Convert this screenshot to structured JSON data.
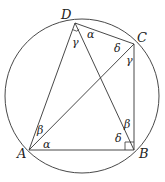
{
  "diagram": {
    "colors": {
      "stroke": "#333333",
      "text": "#222222",
      "background": "#ffffff"
    },
    "circle": {
      "cx": 82,
      "cy": 96,
      "r": 77
    },
    "points": {
      "A": {
        "label": "A",
        "x": 29,
        "y": 150
      },
      "B": {
        "label": "B",
        "x": 134,
        "y": 150
      },
      "C": {
        "label": "C",
        "x": 134,
        "y": 44
      },
      "D": {
        "label": "D",
        "x": 75,
        "y": 23
      }
    },
    "segments": [
      "AB",
      "BC",
      "CD",
      "DA",
      "AC",
      "DB"
    ],
    "right_angles": [
      "D",
      "B"
    ],
    "angle_labels": {
      "D_gamma": "γ",
      "D_alpha": "α",
      "C_delta": "δ",
      "C_gamma": "γ",
      "A_beta": "β",
      "A_alpha": "α",
      "B_beta": "β",
      "B_delta": "δ"
    }
  }
}
